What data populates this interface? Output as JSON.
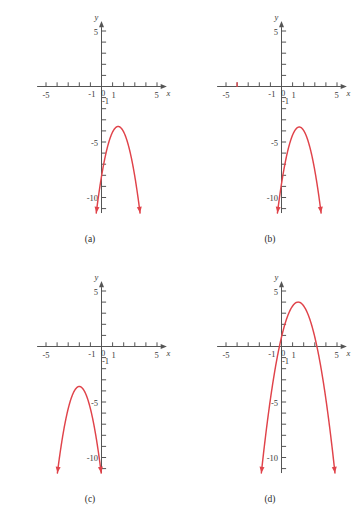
{
  "figure": {
    "type": "multi-panel-graph-figure",
    "panel_count": 4,
    "background_color": "#ffffff",
    "curve_color": "#e0434a",
    "axis_color": "#555555"
  },
  "axes": {
    "x_label": "x",
    "y_label": "y",
    "x_tick_labels": [
      "-5",
      "-1",
      "0",
      "1",
      "5"
    ],
    "y_tick_labels": [
      "5",
      "-1",
      "-5",
      "-10"
    ],
    "x_min": -5.8,
    "x_max": 5.8,
    "y_min": -11.4,
    "y_max": 5.8,
    "x_tick_step": 1,
    "y_tick_step": 1,
    "grid": false
  },
  "panels": [
    {
      "caption": "(a)",
      "chart_data": {
        "type": "line",
        "title": "(a)",
        "xlabel": "x",
        "ylabel": "y",
        "xlim": [
          -5.8,
          5.8
        ],
        "ylim": [
          -11.4,
          5.8
        ],
        "grid": false,
        "curve": "downward parabola, vertex below x-axis, right of y-axis",
        "vertex": [
          1.5,
          -3.6
        ],
        "leading_coefficient": -2.0,
        "x_intercepts": [],
        "y_intercept": -8.1,
        "arrows": [
          "left-branch-down",
          "right-branch-down"
        ],
        "x": [
          -0.45,
          -0.2,
          0.1,
          0.4,
          0.7,
          1.0,
          1.3,
          1.5,
          1.8,
          2.1,
          2.4,
          2.7,
          3.0,
          3.3,
          3.5
        ],
        "y": [
          -11.4,
          -9.4,
          -7.5,
          -5.9,
          -4.9,
          -4.1,
          -3.7,
          -3.6,
          -3.8,
          -4.3,
          -5.2,
          -6.5,
          -8.1,
          -10.1,
          -11.4
        ]
      }
    },
    {
      "caption": "(b)",
      "chart_data": {
        "type": "line",
        "title": "(b)",
        "xlabel": "x",
        "ylabel": "y",
        "xlim": [
          -5.8,
          5.8
        ],
        "ylim": [
          -11.4,
          5.8
        ],
        "grid": false,
        "curve": "downward parabola, vertex below x-axis, right of y-axis",
        "vertex": [
          1.6,
          -3.65
        ],
        "leading_coefficient": -2.0,
        "x_intercepts": [],
        "y_intercept": -8.8,
        "marked_tick_x": -4,
        "marked_tick_color": "#e0434a",
        "arrows": [
          "left-branch-down",
          "right-branch-down"
        ],
        "x": [
          -0.3,
          -0.05,
          0.25,
          0.55,
          0.85,
          1.15,
          1.4,
          1.6,
          1.9,
          2.2,
          2.5,
          2.8,
          3.1,
          3.4,
          3.6
        ],
        "y": [
          -11.4,
          -9.4,
          -7.5,
          -5.9,
          -4.8,
          -4.0,
          -3.7,
          -3.65,
          -3.85,
          -4.4,
          -5.3,
          -6.6,
          -8.2,
          -10.2,
          -11.4
        ]
      }
    },
    {
      "caption": "(c)",
      "chart_data": {
        "type": "line",
        "title": "(c)",
        "xlabel": "x",
        "ylabel": "y",
        "xlim": [
          -5.8,
          5.8
        ],
        "ylim": [
          -11.4,
          5.8
        ],
        "grid": false,
        "curve": "downward parabola, vertex below x-axis, left of y-axis",
        "vertex": [
          -2.0,
          -3.6
        ],
        "leading_coefficient": -2.0,
        "x_intercepts": [],
        "y_intercept": -11.6,
        "arrows": [
          "left-branch-down",
          "right-branch-down"
        ],
        "x": [
          -3.95,
          -3.7,
          -3.4,
          -3.1,
          -2.8,
          -2.5,
          -2.2,
          -2.0,
          -1.7,
          -1.4,
          -1.1,
          -0.8,
          -0.5,
          -0.2,
          0.05
        ],
        "y": [
          -11.4,
          -9.4,
          -7.5,
          -5.9,
          -4.8,
          -4.1,
          -3.7,
          -3.6,
          -3.8,
          -4.3,
          -5.2,
          -6.5,
          -8.1,
          -10.1,
          -11.4
        ]
      }
    },
    {
      "caption": "(d)",
      "chart_data": {
        "type": "line",
        "title": "(d)",
        "xlabel": "x",
        "ylabel": "y",
        "xlim": [
          -5.8,
          5.8
        ],
        "ylim": [
          -11.4,
          5.8
        ],
        "grid": false,
        "curve": "downward parabola, vertex above x-axis, crosses both axes",
        "vertex": [
          1.5,
          4.0
        ],
        "leading_coefficient": -1.4,
        "x_intercepts": [
          -0.19,
          3.19
        ],
        "y_intercept": 0.85,
        "arrows": [
          "left-branch-down",
          "right-branch-down"
        ],
        "x": [
          -1.6,
          -1.3,
          -1.0,
          -0.7,
          -0.4,
          -0.1,
          0.3,
          0.7,
          1.1,
          1.5,
          1.9,
          2.3,
          2.7,
          3.1,
          3.5,
          3.9,
          4.3,
          4.6
        ],
        "y": [
          -10.9,
          -8.0,
          -5.4,
          -3.1,
          -1.2,
          0.4,
          2.0,
          3.1,
          3.8,
          4.0,
          3.8,
          3.1,
          2.0,
          0.4,
          -1.6,
          -4.0,
          -6.8,
          -9.2
        ]
      }
    }
  ]
}
